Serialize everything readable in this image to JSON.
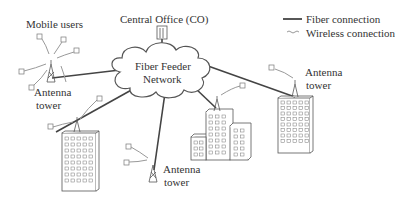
{
  "title_labels": {
    "mobile_users": "Mobile users",
    "central_office": "Central Office (CO)",
    "network": "Fiber Feeder",
    "network_line2": "Network"
  },
  "legend": {
    "fiber": "Fiber connection",
    "wireless": "Wireless connection"
  },
  "towers": [
    {
      "line1": "Antenna",
      "line2": "tower",
      "position": "left"
    },
    {
      "line1": "Antenna",
      "line2": "tower",
      "position": "bottom-center"
    },
    {
      "line1": "Antenna",
      "line2": "tower",
      "position": "right"
    }
  ],
  "colors": {
    "line": "#444444",
    "wireless": "#888888",
    "cloud_stroke": "#555555"
  }
}
